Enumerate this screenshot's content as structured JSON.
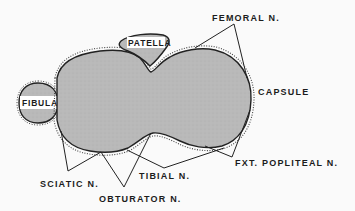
{
  "diagram": {
    "type": "anatomical cross-section",
    "colors": {
      "background": "#fafafa",
      "tissue": "#b9b9b9",
      "outline": "#222222",
      "label_box": "#ffffff",
      "text": "#1c1c1c"
    },
    "structures": {
      "patella": "PATELLA",
      "fibula": "FIBULA"
    },
    "labels": {
      "femoral": "FEMORAL N.",
      "capsule": "CAPSULE",
      "ext_popliteal": "FXT. POPLITEAL N.",
      "tibial": "TIBIAL N.",
      "sciatic": "SCIATIC N.",
      "obturator": "OBTURATOR N."
    }
  }
}
